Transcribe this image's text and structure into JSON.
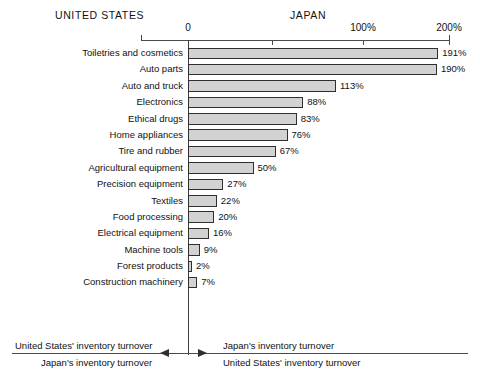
{
  "header": {
    "left_title": "UNITED STATES",
    "right_title": "JAPAN"
  },
  "axis": {
    "ticks": [
      {
        "label": "0",
        "value": 0
      },
      {
        "label": "",
        "value": 50
      },
      {
        "label": "100%",
        "value": 100
      },
      {
        "label": "200%",
        "value": 200
      }
    ],
    "min": 0,
    "max": 200
  },
  "annotation": {
    "left_numerator": "United States' inventory turnover",
    "left_denominator": "Japan's inventory turnover",
    "right_numerator": "Japan's inventory turnover",
    "right_denominator": "United States' inventory turnover",
    "arrow_left": "left-arrow",
    "arrow_right": "right-arrow"
  },
  "source_note": "",
  "colors": {
    "bar_fill": "#d2d2d2",
    "bar_border": "#2f2f2f",
    "axis": "#4a4a4a",
    "text": "#111111"
  },
  "chart_data": {
    "type": "bar",
    "orientation": "horizontal",
    "title": "",
    "subtitle": "",
    "xlabel": "",
    "ylabel": "",
    "xlim": [
      0,
      200
    ],
    "grid": false,
    "legend": "none",
    "value_suffix": "%",
    "categories": [
      "Toiletries and cosmetics",
      "Auto parts",
      "Auto and truck",
      "Electronics",
      "Ethical drugs",
      "Home appliances",
      "Tire and rubber",
      "Agricultural equipment",
      "Precision equipment",
      "Textiles",
      "Food processing",
      "Electrical equipment",
      "Machine tools",
      "Forest products",
      "Construction machinery"
    ],
    "values": [
      191,
      190,
      113,
      88,
      83,
      76,
      67,
      50,
      27,
      22,
      20,
      16,
      9,
      2,
      7
    ],
    "labels": [
      "191%",
      "190%",
      "113%",
      "88%",
      "83%",
      "76%",
      "67%",
      "50%",
      "27%",
      "22%",
      "20%",
      "16%",
      "9%",
      "2%",
      "7%"
    ],
    "tick_labels": [
      "0",
      "",
      "100%",
      "200%"
    ],
    "annotations": [
      "United States' inventory turnover / Japan's inventory turnover",
      "Japan's inventory turnover / United States' inventory turnover"
    ]
  }
}
